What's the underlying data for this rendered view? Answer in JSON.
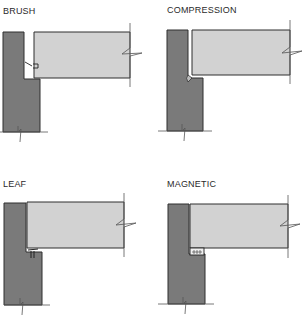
{
  "colors": {
    "frame": "#7a7a7a",
    "door": "#d2d2d2",
    "outline": "#2e2e2e",
    "background": "#ffffff"
  },
  "panels": [
    {
      "id": "brush",
      "label": "BRUSH",
      "seal_type": "brush-seal"
    },
    {
      "id": "compression",
      "label": "COMPRESSION",
      "seal_type": "compression-bulb"
    },
    {
      "id": "leaf",
      "label": "LEAF",
      "seal_type": "leaf-seal"
    },
    {
      "id": "magnetic",
      "label": "MAGNETIC",
      "seal_type": "magnetic-strip"
    }
  ]
}
